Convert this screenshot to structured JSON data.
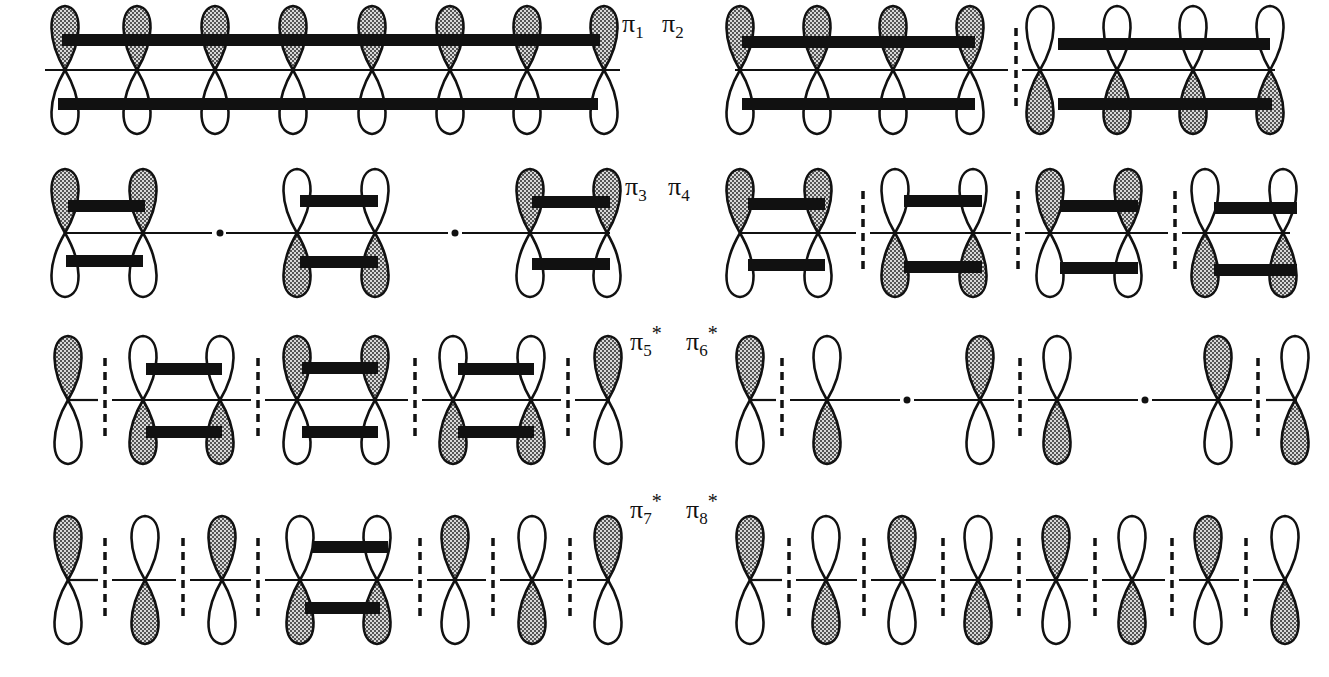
{
  "colors": {
    "ink": "#111111",
    "shade_fg": "#555555",
    "shade_bg": "#d8d8d8",
    "background": "#ffffff"
  },
  "legend": {
    "shaded_lobe": "positive phase (shaded)",
    "open_lobe": "negative phase (open)",
    "bar": "bonding interaction",
    "dashed_line": "nodal plane",
    "dot": "node at atom position"
  },
  "rows": [
    {
      "id": "row1",
      "label_left": {
        "sym": "π",
        "sub": "1",
        "sup": ""
      },
      "label_right": {
        "sym": "π",
        "sub": "2",
        "sup": ""
      },
      "baseline_y": 70
    },
    {
      "id": "row2",
      "label_left": {
        "sym": "π",
        "sub": "3",
        "sup": ""
      },
      "label_right": {
        "sym": "π",
        "sub": "4",
        "sup": ""
      },
      "baseline_y": 233
    },
    {
      "id": "row3",
      "label_left": {
        "sym": "π",
        "sub": "5",
        "sup": "*"
      },
      "label_right": {
        "sym": "π",
        "sub": "6",
        "sup": "*"
      },
      "baseline_y": 400
    },
    {
      "id": "row4",
      "label_left": {
        "sym": "π",
        "sub": "7",
        "sup": "*"
      },
      "label_right": {
        "sym": "π",
        "sub": "8",
        "sup": "*"
      },
      "baseline_y": 580
    }
  ],
  "orbitals": [
    {
      "name": "pi1",
      "y": 70,
      "lobes": [
        [
          65,
          "T"
        ],
        [
          137,
          "T"
        ],
        [
          215,
          "T"
        ],
        [
          293,
          "T"
        ],
        [
          372,
          "T"
        ],
        [
          450,
          "T"
        ],
        [
          527,
          "T"
        ],
        [
          604,
          "T"
        ]
      ],
      "segments": [
        [
          45,
          620
        ]
      ],
      "bars": [
        [
          62,
          600,
          40
        ],
        [
          58,
          598,
          104
        ]
      ],
      "dashes": [],
      "dots": []
    },
    {
      "name": "pi2",
      "y": 70,
      "lobes": [
        [
          740,
          "T"
        ],
        [
          817,
          "T"
        ],
        [
          893,
          "T"
        ],
        [
          970,
          "T"
        ],
        [
          1040,
          "B"
        ],
        [
          1117,
          "B"
        ],
        [
          1193,
          "B"
        ],
        [
          1270,
          "B"
        ]
      ],
      "segments": [
        [
          735,
          1008
        ],
        [
          1022,
          1275
        ]
      ],
      "bars": [
        [
          742,
          975,
          42
        ],
        [
          742,
          975,
          104
        ],
        [
          1058,
          1270,
          44
        ],
        [
          1058,
          1272,
          104
        ]
      ],
      "dashes": [
        1016
      ],
      "dots": []
    },
    {
      "name": "pi3",
      "y": 233,
      "lobes": [
        [
          65,
          "T"
        ],
        [
          143,
          "T"
        ],
        [
          297,
          "B"
        ],
        [
          375,
          "B"
        ],
        [
          530,
          "T"
        ],
        [
          607,
          "T"
        ]
      ],
      "segments": [
        [
          65,
          212
        ],
        [
          226,
          448
        ],
        [
          462,
          610
        ]
      ],
      "bars": [
        [
          68,
          145,
          206
        ],
        [
          66,
          143,
          261
        ],
        [
          300,
          378,
          201
        ],
        [
          300,
          378,
          262
        ],
        [
          532,
          610,
          202
        ],
        [
          532,
          610,
          264
        ]
      ],
      "dashes": [],
      "dots": [
        220,
        455
      ]
    },
    {
      "name": "pi4",
      "y": 233,
      "lobes": [
        [
          740,
          "T"
        ],
        [
          818,
          "T"
        ],
        [
          895,
          "B"
        ],
        [
          973,
          "B"
        ],
        [
          1050,
          "T"
        ],
        [
          1128,
          "T"
        ],
        [
          1205,
          "B"
        ],
        [
          1283,
          "B"
        ]
      ],
      "segments": [
        [
          740,
          856
        ],
        [
          870,
          1011
        ],
        [
          1025,
          1168
        ],
        [
          1182,
          1290
        ]
      ],
      "bars": [
        [
          748,
          825,
          204
        ],
        [
          748,
          825,
          265
        ],
        [
          904,
          982,
          201
        ],
        [
          904,
          982,
          267
        ],
        [
          1060,
          1138,
          206
        ],
        [
          1060,
          1138,
          268
        ],
        [
          1214,
          1297,
          208
        ],
        [
          1214,
          1297,
          270
        ]
      ],
      "dashes": [
        863,
        1018,
        1175
      ],
      "dots": []
    },
    {
      "name": "pi5",
      "y": 400,
      "lobes": [
        [
          68,
          "T"
        ],
        [
          143,
          "B"
        ],
        [
          220,
          "B"
        ],
        [
          297,
          "T"
        ],
        [
          375,
          "T"
        ],
        [
          453,
          "B"
        ],
        [
          531,
          "B"
        ],
        [
          608,
          "T"
        ]
      ],
      "segments": [
        [
          68,
          98
        ],
        [
          112,
          251
        ],
        [
          265,
          408
        ],
        [
          422,
          561
        ],
        [
          575,
          610
        ]
      ],
      "bars": [
        [
          146,
          222,
          369
        ],
        [
          146,
          222,
          432
        ],
        [
          302,
          378,
          368
        ],
        [
          302,
          378,
          432
        ],
        [
          458,
          534,
          369
        ],
        [
          458,
          534,
          432
        ]
      ],
      "dashes": [
        105,
        258,
        415,
        568
      ],
      "dots": []
    },
    {
      "name": "pi6",
      "y": 400,
      "lobes": [
        [
          750,
          "T"
        ],
        [
          827,
          "B"
        ],
        [
          980,
          "T"
        ],
        [
          1057,
          "B"
        ],
        [
          1218,
          "T"
        ],
        [
          1295,
          "B"
        ]
      ],
      "segments": [
        [
          750,
          776
        ],
        [
          790,
          900
        ],
        [
          914,
          1014
        ],
        [
          1028,
          1138
        ],
        [
          1152,
          1252
        ],
        [
          1266,
          1297
        ]
      ],
      "bars": [],
      "dashes": [
        782,
        1020,
        1258
      ],
      "dots": [
        907,
        1145
      ]
    },
    {
      "name": "pi7",
      "y": 580,
      "lobes": [
        [
          68,
          "T"
        ],
        [
          145,
          "B"
        ],
        [
          222,
          "T"
        ],
        [
          300,
          "B"
        ],
        [
          377,
          "B"
        ],
        [
          455,
          "T"
        ],
        [
          532,
          "B"
        ],
        [
          608,
          "T"
        ]
      ],
      "segments": [
        [
          68,
          98
        ],
        [
          112,
          176
        ],
        [
          190,
          251
        ],
        [
          265,
          413
        ],
        [
          427,
          486
        ],
        [
          500,
          563
        ],
        [
          577,
          610
        ]
      ],
      "bars": [
        [
          312,
          388,
          547
        ],
        [
          305,
          380,
          608
        ]
      ],
      "dashes": [
        105,
        183,
        258,
        420,
        493,
        570
      ],
      "dots": []
    },
    {
      "name": "pi8",
      "y": 580,
      "lobes": [
        [
          750,
          "T"
        ],
        [
          826,
          "B"
        ],
        [
          902,
          "T"
        ],
        [
          978,
          "B"
        ],
        [
          1056,
          "T"
        ],
        [
          1132,
          "B"
        ],
        [
          1208,
          "T"
        ],
        [
          1285,
          "B"
        ]
      ],
      "segments": [
        [
          750,
          782
        ],
        [
          796,
          857
        ],
        [
          871,
          936
        ],
        [
          950,
          1012
        ],
        [
          1026,
          1088
        ],
        [
          1102,
          1165
        ],
        [
          1179,
          1239
        ],
        [
          1253,
          1287
        ]
      ],
      "bars": [],
      "dashes": [
        789,
        864,
        943,
        1019,
        1095,
        1172,
        1246
      ],
      "dots": []
    }
  ]
}
